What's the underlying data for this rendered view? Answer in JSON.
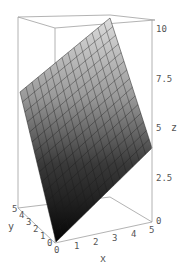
{
  "chart_data": {
    "type": "surface3d",
    "title": "",
    "function": "z = x + y",
    "xlabel": "x",
    "ylabel": "y",
    "zlabel": "z",
    "xlim": [
      0,
      5
    ],
    "ylim": [
      0,
      5
    ],
    "zlim": [
      0,
      10
    ],
    "x_ticks": [
      "0",
      "1",
      "2",
      "3",
      "4",
      "5"
    ],
    "y_ticks": [
      "0",
      "1",
      "2",
      "3",
      "4",
      "5"
    ],
    "z_ticks": [
      "0",
      "2.5",
      "5",
      "7.5",
      "10"
    ],
    "mesh": "15x15",
    "corner_values": [
      {
        "x": 0,
        "y": 0,
        "z": 0
      },
      {
        "x": 5,
        "y": 0,
        "z": 5
      },
      {
        "x": 0,
        "y": 5,
        "z": 5
      },
      {
        "x": 5,
        "y": 5,
        "z": 10
      }
    ],
    "grid": false,
    "box": true,
    "shading": "grayscale, light at top to dark at bottom"
  },
  "colors": {
    "box_line": "#9a9a9a",
    "mesh_line": "#222222",
    "surface_top": "#d8d8d8",
    "surface_bottom": "#0a0a0a",
    "tick_text": "#555555"
  }
}
